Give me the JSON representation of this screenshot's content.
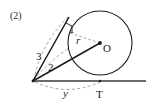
{
  "figure": {
    "problem_label": "(2)",
    "labels": {
      "tangent_upper_segment": "1",
      "hypotenuse": "3",
      "tangent_lower_segment": "2",
      "radius": "r",
      "center": "O",
      "tangent_point": "T",
      "base_length": "y"
    },
    "colors": {
      "stroke": "#1c1c1c",
      "dashed": "#8a8a8a",
      "baseline": "#3a3a3a",
      "background": "#ffffff"
    },
    "geometry": {
      "circle_center": [
        100,
        43
      ],
      "circle_radius": 32,
      "tangent_point_T": [
        100,
        81
      ],
      "external_point": [
        33,
        81
      ],
      "upper_tangent_point": [
        69,
        17
      ],
      "inner_point": [
        57,
        57
      ],
      "baseline_y": 81,
      "baseline_x_start": 33,
      "baseline_x_end": 146
    }
  }
}
